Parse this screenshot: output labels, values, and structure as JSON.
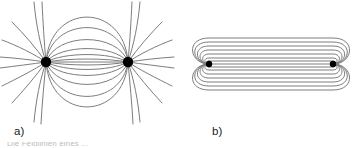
{
  "figure": {
    "background_color": "#ffffff",
    "line_color": "#7d7d7d",
    "pole_color": "#000000",
    "label_color": "#1a1a1a"
  },
  "panels": [
    {
      "id": "a",
      "label": "a)",
      "title": "dipole-field-lines",
      "description": "Field lines of a magnetic dipole pair: two point poles joined by nested arcs with lines radiating outward",
      "poles": [
        {
          "name": "left-pole",
          "x": 46,
          "y": 62,
          "radius": 5
        },
        {
          "name": "right-pole",
          "x": 128,
          "y": 62,
          "radius": 5
        }
      ],
      "inner_arcs_count": 6,
      "radiating_lines_count": 18,
      "axis_line_y": 62
    },
    {
      "id": "b",
      "label": "b)",
      "title": "solenoid-field-lines",
      "description": "Elongated stadium-shaped nested closed field loops between two end points",
      "nodes": [
        {
          "name": "left-node",
          "x": 30,
          "y": 64,
          "radius": 3
        },
        {
          "name": "right-node",
          "x": 154,
          "y": 64,
          "radius": 3
        }
      ],
      "loop_count": 7,
      "axis_line_y": 64
    }
  ],
  "caption": {
    "text": "Die Feldlinien eines ..."
  }
}
